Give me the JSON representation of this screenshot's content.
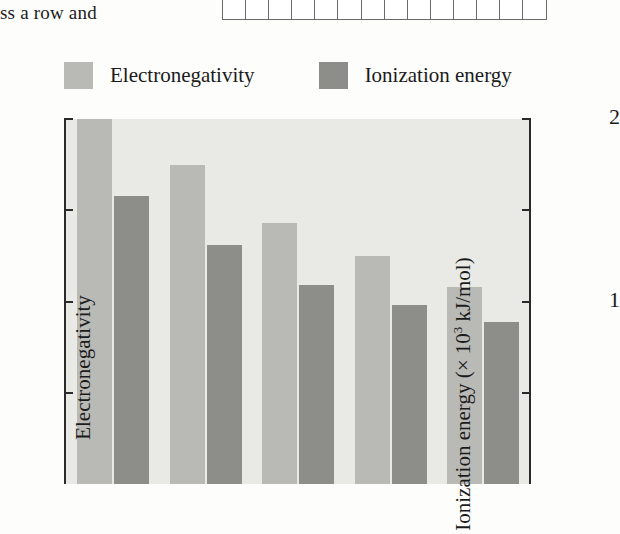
{
  "page": {
    "fragment_text": "ss a row and",
    "answer_grid_cells": 14
  },
  "legend": [
    {
      "label": "Electronegativity",
      "color": "#b9bab6",
      "swatch_name": "legend-swatch-electronegativity"
    },
    {
      "label": "Ionization energy",
      "color": "#8d8e8a",
      "swatch_name": "legend-swatch-ionization-energy"
    }
  ],
  "axes": {
    "left": {
      "title": "Electronegativity",
      "ticks": [
        {
          "value": 4,
          "label": "4"
        },
        {
          "value": 3,
          "label": "3"
        },
        {
          "value": 2,
          "label": "2"
        },
        {
          "value": 1,
          "label": "1"
        }
      ],
      "min": 0,
      "max": 4
    },
    "right": {
      "title_prefix": "Ionization energy (× 10",
      "title_exponent": "3",
      "title_suffix": " kJ/mol)",
      "ticks": [
        {
          "value": 2,
          "label": "2"
        },
        {
          "value": 1.5,
          "label": ""
        },
        {
          "value": 1,
          "label": "1"
        },
        {
          "value": 0.5,
          "label": ""
        }
      ],
      "min": 0,
      "max": 2
    }
  },
  "chart_data": {
    "type": "bar",
    "title": "",
    "xlabel": "",
    "ylabel": "Electronegativity",
    "y2label": "Ionization energy (× 10³ kJ/mol)",
    "ylim": [
      0,
      4
    ],
    "y2lim": [
      0,
      2
    ],
    "grid": false,
    "legend_position": "top-left",
    "categories": [
      "1",
      "2",
      "3",
      "4",
      "5"
    ],
    "series": [
      {
        "name": "Electronegativity",
        "axis": "left",
        "color": "#b9bab6",
        "values": [
          4.0,
          3.5,
          2.86,
          2.5,
          2.16
        ]
      },
      {
        "name": "Ionization energy",
        "axis": "right",
        "color": "#8d8e8a",
        "values": [
          1.58,
          1.31,
          1.09,
          0.98,
          0.89
        ]
      }
    ],
    "ionization_energy_left_scale_equivalent": [
      3.15,
      2.62,
      2.18,
      1.96,
      1.77
    ]
  }
}
